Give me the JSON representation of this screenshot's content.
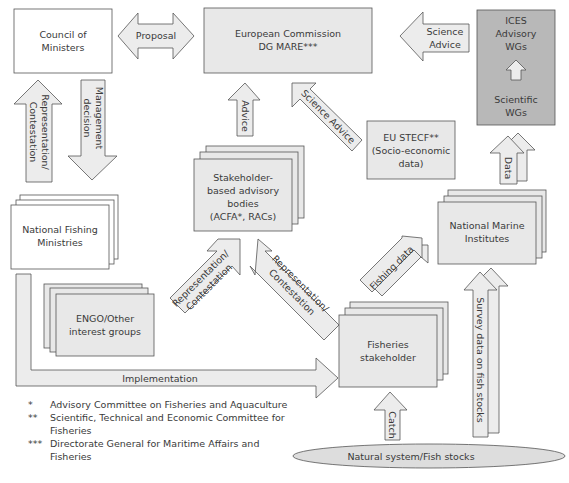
{
  "colors": {
    "box_white": "#ffffff",
    "box_light": "#e8e8e8",
    "box_dark": "#b8b8b8",
    "arrow_fill": "#ececec",
    "stroke": "#555555"
  },
  "nodes": {
    "council": [
      "Council of",
      "Ministers"
    ],
    "proposal": "Proposal",
    "commission": [
      "European Commission",
      "DG MARE***"
    ],
    "science_advice_ices": [
      "Science",
      "Advice"
    ],
    "ices": {
      "top": [
        "ICES",
        "Advisory",
        "WGs"
      ],
      "bottom": [
        "Scientific",
        "WGs"
      ]
    },
    "representation_left": [
      "Representation/",
      "Contestation"
    ],
    "management_decision": [
      "Management",
      "decision"
    ],
    "advice": "Advice",
    "science_advice_stecf": "Science Advice",
    "stecf": [
      "EU STECF**",
      "(Socio-economic",
      "data)"
    ],
    "data": "Data",
    "stakeholder_bodies": [
      "Stakeholder-",
      "based advisory",
      "bodies",
      "(ACFA*, RACs)"
    ],
    "national_fishing": [
      "National Fishing",
      "Ministries"
    ],
    "engo": [
      "ENGO/Other",
      "interest groups"
    ],
    "rep_contest_a": [
      "Representation/",
      "Contestation"
    ],
    "rep_contest_b": [
      "Representation/",
      "Contestation"
    ],
    "fishing_data": "Fishing data",
    "national_marine": [
      "National Marine",
      "Institutes"
    ],
    "survey_data": "Survey data on fish stocks",
    "fisheries_stakeholder": [
      "Fisheries",
      "stakeholder"
    ],
    "implementation": "Implementation",
    "catch": "Catch",
    "natural_system": "Natural system/Fish stocks"
  },
  "legend": [
    {
      "marker": "*",
      "text": "Advisory Committee on Fisheries and Aquaculture"
    },
    {
      "marker": "**",
      "text": "Scientific, Technical and Economic Committee for Fisheries"
    },
    {
      "marker": "***",
      "text": "Directorate General for Maritime Affairs and Fisheries"
    }
  ]
}
